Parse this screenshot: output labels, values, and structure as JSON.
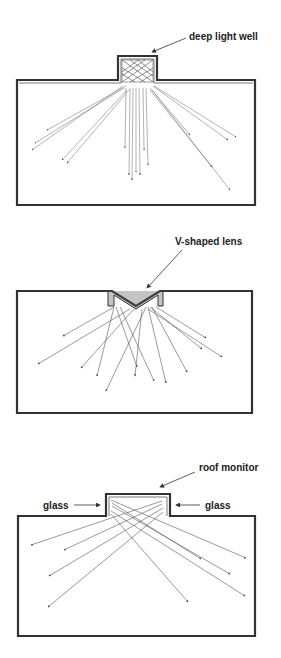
{
  "diagrams": [
    {
      "name": "deep-light-well",
      "label": "deep light well"
    },
    {
      "name": "v-shaped-lens",
      "label": "V-shaped lens"
    },
    {
      "name": "roof-monitor",
      "label": "roof monitor",
      "side_labels": [
        "glass",
        "glass"
      ]
    }
  ],
  "colors": {
    "line": "#333333",
    "ray": "#555555",
    "background": "#ffffff"
  }
}
